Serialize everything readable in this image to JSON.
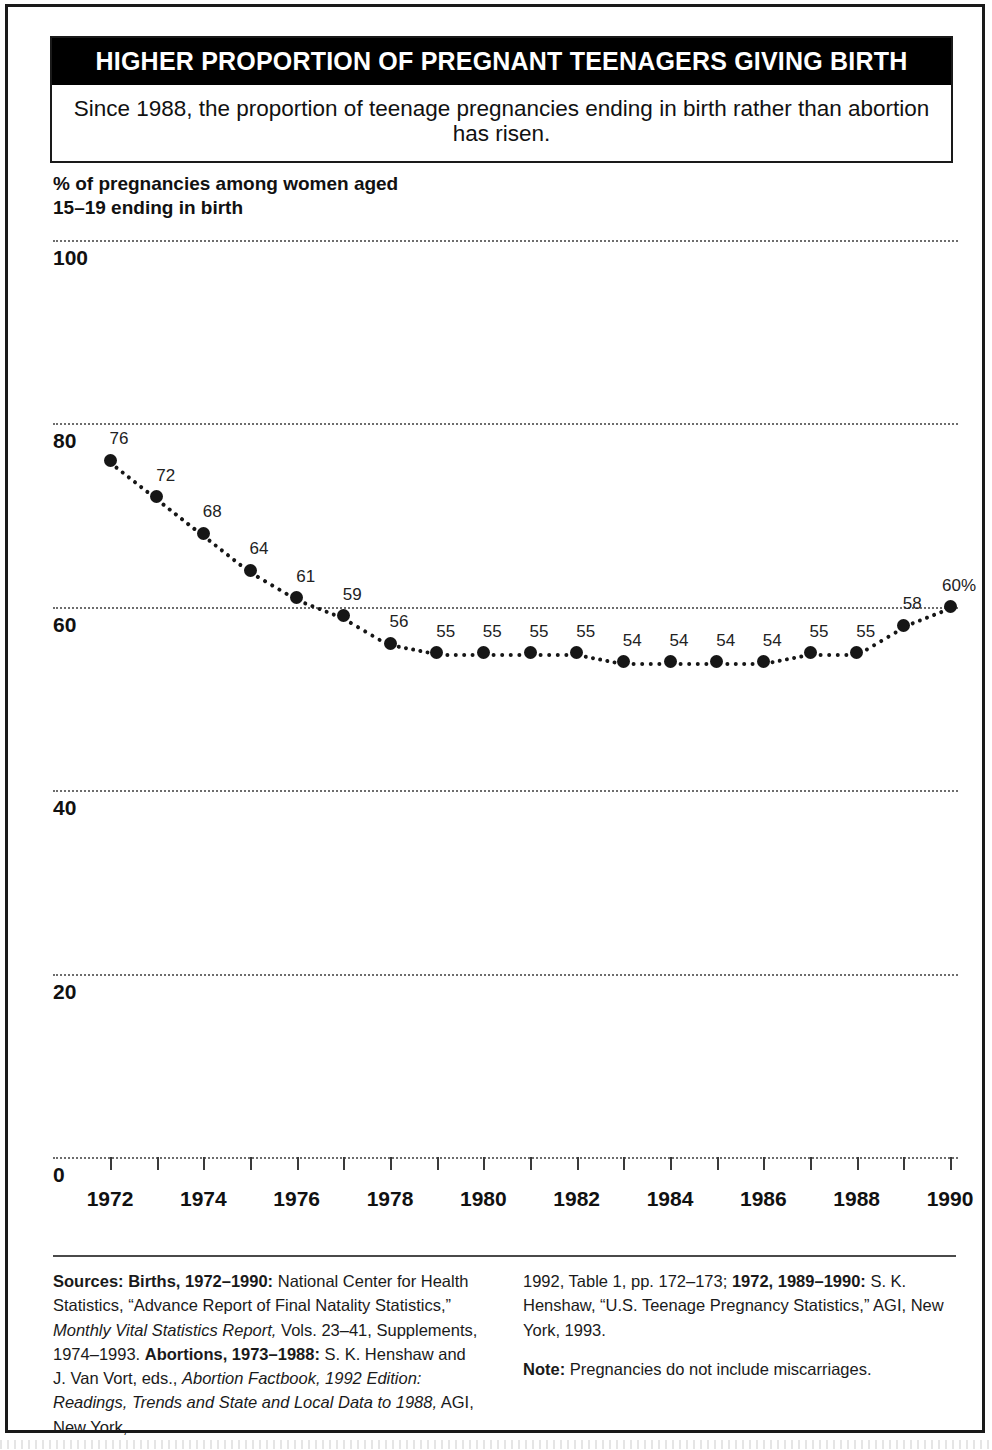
{
  "figure": {
    "title": "HIGHER PROPORTION OF PREGNANT TEENAGERS GIVING BIRTH",
    "subtitle": "Since 1988, the proportion of teenage pregnancies ending in birth rather than abortion has risen.",
    "axis_caption_line1": "% of pregnancies among women aged",
    "axis_caption_line2": "15–19 ending in birth"
  },
  "colors": {
    "title_bar_bg": "#000000",
    "title_bar_text": "#ffffff",
    "frame": "#1a1a1a",
    "marker": "#161616",
    "gridline": "#6d6d6d",
    "page_bg": "#ffffff"
  },
  "chart_data": {
    "type": "line",
    "title": "% of pregnancies among women aged 15–19 ending in birth",
    "xlabel": "",
    "ylabel": "% of pregnancies among women aged 15–19 ending in birth",
    "xlim": [
      1972,
      1990
    ],
    "ylim": [
      0,
      100
    ],
    "ytick_labels": [
      "100",
      "80",
      "60",
      "40",
      "20",
      "0"
    ],
    "yticks": [
      100,
      80,
      60,
      40,
      20,
      0
    ],
    "xtick_labels": [
      "1972",
      "1974",
      "1976",
      "1978",
      "1980",
      "1982",
      "1984",
      "1986",
      "1988",
      "1990"
    ],
    "xticks": [
      1972,
      1974,
      1976,
      1978,
      1980,
      1982,
      1984,
      1986,
      1988,
      1990
    ],
    "minor_xticks_every": 1,
    "grid": "horizontal-dotted",
    "legend": "none",
    "marker_style": "filled-circle",
    "line_style": "dotted",
    "x": [
      1972,
      1973,
      1974,
      1975,
      1976,
      1977,
      1978,
      1979,
      1980,
      1981,
      1982,
      1983,
      1984,
      1985,
      1986,
      1987,
      1988,
      1989,
      1990
    ],
    "values": [
      76,
      72,
      68,
      64,
      61,
      59,
      56,
      55,
      55,
      55,
      55,
      54,
      54,
      54,
      54,
      55,
      55,
      58,
      60
    ],
    "point_labels": [
      "76",
      "72",
      "68",
      "64",
      "61",
      "59",
      "56",
      "55",
      "55",
      "55",
      "55",
      "54",
      "54",
      "54",
      "54",
      "55",
      "55",
      "58",
      "60%"
    ]
  },
  "footnotes": {
    "left_html": "<b>Sources: Births, 1972–1990:</b> National Center for Health Statistics, “Advance Report of Final Natality Statistics,” <i>Monthly Vital Statistics Report,</i> Vols. 23–41, Supplements, 1974–1993. <b>Abortions, 1973–1988:</b> S. K. Henshaw and J. Van Vort, eds., <i>Abortion Factbook, 1992 Edition: Readings, Trends and State and Local Data to 1988,</i> AGI, New York,",
    "right_html_1": "1992, Table 1, pp. 172–173; <b>1972, 1989–1990:</b> S. K. Henshaw, “U.S. Teenage Pregnancy Statistics,” AGI, New York, 1993.",
    "right_html_2": "<b>Note:</b> Pregnancies do not include miscarriages."
  }
}
